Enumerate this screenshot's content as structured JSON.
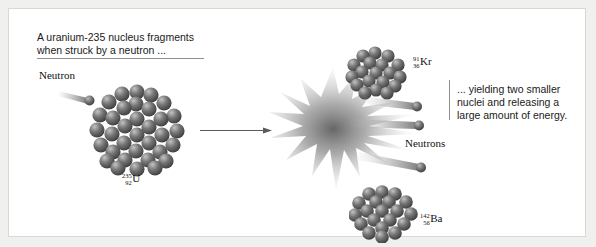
{
  "figure": {
    "title_caption": "A uranium-235 nucleus fragments\nwhen struck by a neutron ...",
    "result_caption": "... yielding two smaller\nnuclei and releasing a\nlarge amount of energy."
  },
  "labels": {
    "incoming_neutron": "Neutron",
    "emitted_neutrons": "Neutrons"
  },
  "isotopes": {
    "uranium": {
      "mass_number": "235",
      "atomic_number": "92",
      "symbol": "U"
    },
    "krypton": {
      "mass_number": "91",
      "atomic_number": "36",
      "symbol": "Kr"
    },
    "barium": {
      "mass_number": "142",
      "atomic_number": "56",
      "symbol": "Ba"
    }
  },
  "colors": {
    "background": "#f0f0ef",
    "panel": "#ffffff",
    "text": "#1a1a1a",
    "rule": "#8e8e8e",
    "nucleon_dark": "#4a4a4a",
    "nucleon_light": "#a9a9a9",
    "burst": "#6b6b6b"
  }
}
